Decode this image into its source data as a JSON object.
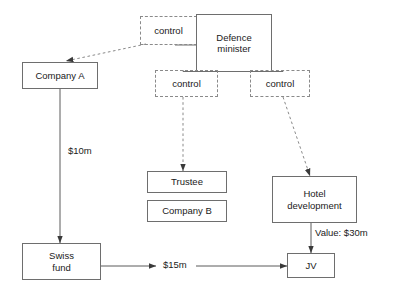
{
  "diagram": {
    "style": {
      "solid_border_color": "#6e6e6e",
      "dashed_border_color": "#8a8a8a",
      "line_color": "#5a5a5a",
      "dashed_line_color": "#8a8a8a",
      "text_color": "#1a1a1a",
      "background": "#ffffff"
    },
    "nodes": [
      {
        "id": "control_top",
        "label": "control",
        "kind": "dashed"
      },
      {
        "id": "defence_minister",
        "label": "Defence\nminister",
        "kind": "solid"
      },
      {
        "id": "control_left",
        "label": "control",
        "kind": "dashed"
      },
      {
        "id": "control_right",
        "label": "control",
        "kind": "dashed"
      },
      {
        "id": "company_a",
        "label": "Company A",
        "kind": "solid"
      },
      {
        "id": "trustee",
        "label": "Trustee",
        "kind": "solid"
      },
      {
        "id": "company_b",
        "label": "Company B",
        "kind": "solid"
      },
      {
        "id": "hotel_development",
        "label": "Hotel\ndevelopment",
        "kind": "solid"
      },
      {
        "id": "swiss_fund",
        "label": "Swiss\nfund",
        "kind": "solid"
      },
      {
        "id": "jv",
        "label": "JV",
        "kind": "solid"
      }
    ],
    "node_labels": {
      "control_top": "control",
      "defence_minister_line1": "Defence",
      "defence_minister_line2": "minister",
      "control_left": "control",
      "control_right": "control",
      "company_a": "Company A",
      "trustee": "Trustee",
      "company_b": "Company B",
      "hotel_development_line1": "Hotel",
      "hotel_development_line2": "development",
      "swiss_fund_line1": "Swiss",
      "swiss_fund_line2": "fund",
      "jv": "JV"
    },
    "edges": [
      {
        "id": "dm_to_control_top",
        "from": "defence_minister",
        "to": "control_top",
        "style": "solid",
        "arrow": false,
        "label": ""
      },
      {
        "id": "control_top_to_coa",
        "from": "control_top",
        "to": "company_a",
        "style": "dashed",
        "arrow": true,
        "label": ""
      },
      {
        "id": "dm_to_control_left",
        "from": "defence_minister",
        "to": "control_left",
        "style": "solid",
        "arrow": false,
        "label": ""
      },
      {
        "id": "dm_to_control_right",
        "from": "defence_minister",
        "to": "control_right",
        "style": "solid",
        "arrow": false,
        "label": ""
      },
      {
        "id": "control_left_trustee",
        "from": "control_left",
        "to": "trustee",
        "style": "dashed",
        "arrow": true,
        "label": ""
      },
      {
        "id": "control_right_hotel",
        "from": "control_right",
        "to": "hotel_development",
        "style": "dashed",
        "arrow": true,
        "label": ""
      },
      {
        "id": "coa_to_swiss",
        "from": "company_a",
        "to": "swiss_fund",
        "style": "solid",
        "arrow": true,
        "label": "$10m"
      },
      {
        "id": "swiss_to_jv",
        "from": "swiss_fund",
        "to": "jv",
        "style": "solid",
        "arrow": true,
        "label": "$15m"
      },
      {
        "id": "hotel_to_jv",
        "from": "hotel_development",
        "to": "jv",
        "style": "solid",
        "arrow": true,
        "label": "Value: $30m"
      }
    ],
    "edge_labels": {
      "amount_10m": "$10m",
      "amount_15m": "$15m",
      "value_30m": "Value: $30m"
    }
  }
}
